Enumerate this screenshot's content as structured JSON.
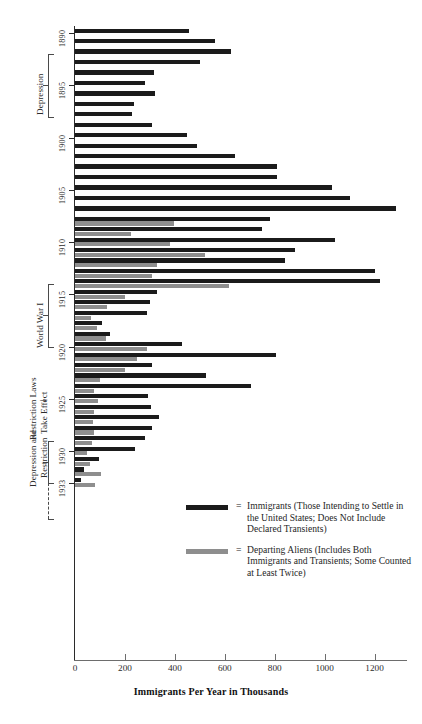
{
  "chart_data": {
    "type": "bar",
    "orientation": "horizontal",
    "title": "",
    "xlabel": "Immigrants Per Year in Thousands",
    "ylabel": "",
    "xlim": [
      0,
      1330
    ],
    "xticks": [
      0,
      200,
      400,
      600,
      800,
      1000,
      1200
    ],
    "xtick_labels": [
      "0",
      "200",
      "400",
      "600",
      "800",
      "1000",
      "1200"
    ],
    "grid": false,
    "legend_position": "center-right",
    "year_ticks": [
      1890,
      1895,
      1900,
      1905,
      1910,
      1915,
      1920,
      1925,
      1930,
      1933
    ],
    "categories": [
      1890,
      1891,
      1892,
      1893,
      1894,
      1895,
      1896,
      1897,
      1898,
      1899,
      1900,
      1901,
      1902,
      1903,
      1904,
      1905,
      1906,
      1907,
      1908,
      1909,
      1910,
      1911,
      1912,
      1913,
      1914,
      1915,
      1916,
      1917,
      1918,
      1919,
      1920,
      1921,
      1922,
      1923,
      1924,
      1925,
      1926,
      1927,
      1928,
      1929,
      1930,
      1931,
      1932,
      1933
    ],
    "series": [
      {
        "name": "Immigrants (Those Intending to Settle in the United States; Does Not Include Declared Transients)",
        "color": "#1b1b1b",
        "values": [
          455,
          560,
          623,
          502,
          315,
          280,
          320,
          235,
          230,
          310,
          450,
          490,
          640,
          810,
          810,
          1030,
          1100,
          1285,
          780,
          750,
          1040,
          880,
          840,
          1200,
          1220,
          330,
          300,
          290,
          110,
          140,
          430,
          805,
          310,
          523,
          707,
          294,
          304,
          335,
          307,
          280,
          242,
          97,
          36,
          23
        ],
        "estimated": true
      },
      {
        "name": "Departing Aliens (Includes Both Immigrants and Transients; Some Counted at Least Twice)",
        "color": "#8e8e8e",
        "values": [
          null,
          null,
          null,
          null,
          null,
          null,
          null,
          null,
          null,
          null,
          null,
          null,
          null,
          null,
          null,
          null,
          null,
          null,
          395,
          225,
          380,
          520,
          330,
          310,
          615,
          200,
          130,
          65,
          90,
          125,
          290,
          250,
          200,
          100,
          76,
          92,
          77,
          73,
          78,
          70,
          50,
          62,
          103,
          80
        ],
        "estimated": true
      }
    ],
    "annotations": [
      {
        "label": "Depression",
        "years": [
          1893,
          1897
        ],
        "type": "bracket"
      },
      {
        "label": "World War I",
        "years": [
          1914,
          1920
        ],
        "type": "bracket"
      },
      {
        "label": "Restriction Laws Take Effect",
        "year": 1925,
        "type": "arrow"
      },
      {
        "label": "Depression and Restriction",
        "years": [
          1929,
          1933
        ],
        "type": "bracket"
      }
    ]
  },
  "legend": {
    "equals": "=",
    "items": [
      {
        "swatch": "imm",
        "text": "Immigrants (Those Intending to Settle in the United States; Does Not Include Declared Transients)"
      },
      {
        "swatch": "dep",
        "text": "Departing Aliens (Includes Both Immigrants and Transients; Some Counted at Least Twice)"
      }
    ]
  },
  "axis": {
    "x_title": "Immigrants Per Year in Thousands"
  },
  "eras": {
    "depression": "Depression",
    "world_war_one": "World War I",
    "restriction_line1": "Restriction Laws",
    "restriction_line2": "Take Effect",
    "depression_restriction_line1": "Depression and",
    "depression_restriction_line2": "Restriction",
    "arrow_glyph": "→"
  }
}
